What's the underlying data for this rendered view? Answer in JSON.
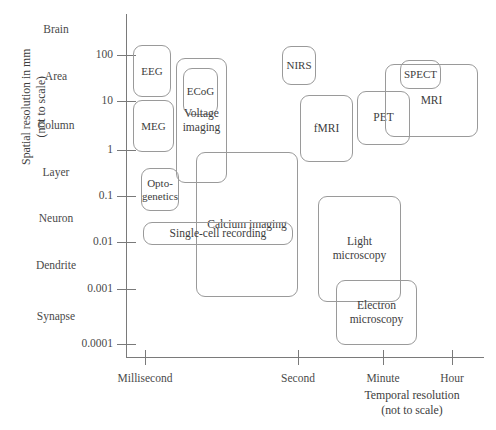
{
  "chart_data": {
    "type": "scatter",
    "title": "",
    "xlabel": "Temporal resolution\n(not to scale)",
    "ylabel": "Spatial resolution in mm\n(not to scale)",
    "x_axis": {
      "label_line1": "Temporal resolution",
      "label_line2": "(not to scale)",
      "ticks": [
        {
          "label": "Millisecond",
          "px": 145
        },
        {
          "label": "Second",
          "px": 298
        },
        {
          "label": "Minute",
          "px": 383
        },
        {
          "label": "Hour",
          "px": 452
        }
      ]
    },
    "y_axis": {
      "label_line1": "Spatial resolution in mm",
      "label_line2": "(not to scale)",
      "numeric_ticks": [
        {
          "label": "100",
          "px": 55
        },
        {
          "label": "10",
          "px": 101
        },
        {
          "label": "1",
          "px": 150
        },
        {
          "label": "0.1",
          "px": 196
        },
        {
          "label": "0.01",
          "px": 242
        },
        {
          "label": "0.001",
          "px": 289
        },
        {
          "label": "0.0001",
          "px": 344
        }
      ],
      "scale_words": [
        {
          "label": "Brain",
          "px": 30
        },
        {
          "label": "Area",
          "px": 77
        },
        {
          "label": "Column",
          "px": 126
        },
        {
          "label": "Layer",
          "px": 173
        },
        {
          "label": "Neuron",
          "px": 219
        },
        {
          "label": "Dendrite",
          "px": 266
        },
        {
          "label": "Synapse",
          "px": 317
        }
      ]
    },
    "grid": false,
    "legend": "none",
    "boxes": [
      {
        "name": "EEG",
        "label": "EEG",
        "x": 133,
        "y": 45,
        "w": 38,
        "h": 52
      },
      {
        "name": "MEG",
        "label": "MEG",
        "x": 133,
        "y": 100,
        "w": 41,
        "h": 52
      },
      {
        "name": "ECoG",
        "label": "ECoG",
        "x": 183,
        "y": 68,
        "w": 35,
        "h": 47
      },
      {
        "name": "voltage-imaging",
        "label": "Voltage\nimaging",
        "x": 176,
        "y": 58,
        "w": 51,
        "h": 125
      },
      {
        "name": "optogenetics",
        "label": "Opto-\ngenetics",
        "x": 141,
        "y": 168,
        "w": 38,
        "h": 43
      },
      {
        "name": "calcium-imaging",
        "label": "Calcium imaging",
        "x": 196,
        "y": 152,
        "w": 102,
        "h": 145
      },
      {
        "name": "single-cell-recording",
        "label": "Single-cell recording",
        "x": 143,
        "y": 222,
        "w": 150,
        "h": 23
      },
      {
        "name": "NIRS",
        "label": "NIRS",
        "x": 282,
        "y": 46,
        "w": 34,
        "h": 39
      },
      {
        "name": "fMRI",
        "label": "fMRI",
        "x": 300,
        "y": 95,
        "w": 53,
        "h": 67
      },
      {
        "name": "PET",
        "label": "PET",
        "x": 357,
        "y": 91,
        "w": 53,
        "h": 54
      },
      {
        "name": "MRI",
        "label": "MRI",
        "x": 385,
        "y": 64,
        "w": 93,
        "h": 73
      },
      {
        "name": "SPECT",
        "label": "SPECT",
        "x": 400,
        "y": 60,
        "w": 41,
        "h": 29
      },
      {
        "name": "light-microscopy",
        "label": "Light\nmicroscopy",
        "x": 318,
        "y": 196,
        "w": 83,
        "h": 106
      },
      {
        "name": "electron-microscopy",
        "label": "Electron\nmicroscopy",
        "x": 336,
        "y": 280,
        "w": 81,
        "h": 65
      }
    ]
  },
  "colors": {
    "box_stroke": "#9a9a9a",
    "axis": "#7a7a7a",
    "text": "#3d3d3d",
    "background": "#ffffff"
  }
}
